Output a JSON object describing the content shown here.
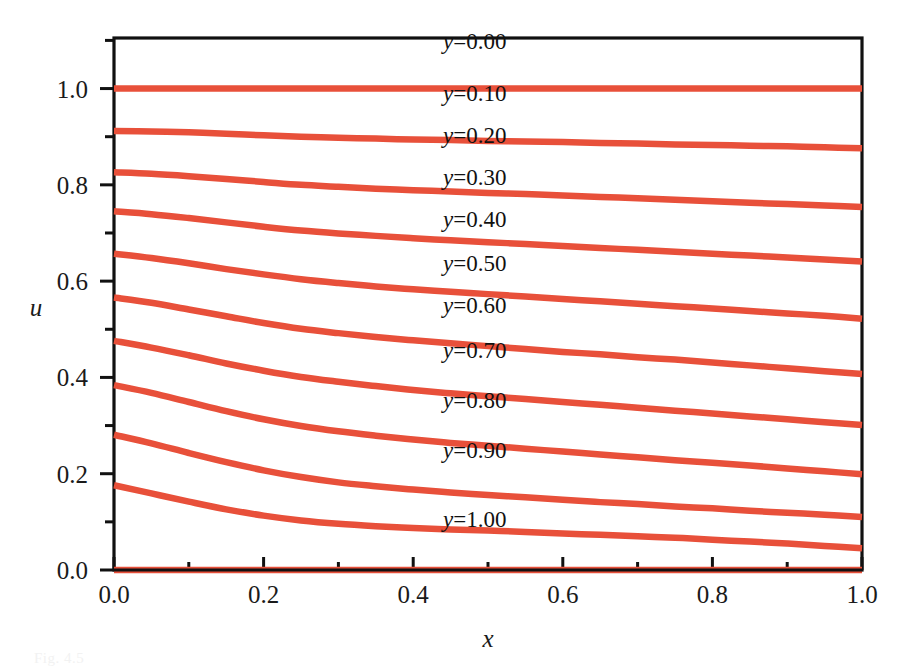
{
  "figure": {
    "background_color": "#ffffff",
    "axis_color": "#111111",
    "curve_color": "#e8503a",
    "caption": "Fig. 4.5"
  },
  "axes": {
    "x_title": "x",
    "y_title": "u",
    "x_ticks": [
      "0.0",
      "0.2",
      "0.4",
      "0.6",
      "0.8",
      "1.0"
    ],
    "y_ticks": [
      "0.0",
      "0.2",
      "0.4",
      "0.6",
      "0.8",
      "1.0"
    ]
  },
  "chart_data": {
    "type": "line",
    "title": "",
    "subtitle": "",
    "xlabel": "x",
    "ylabel": "u",
    "xlim": [
      0.0,
      1.0
    ],
    "ylim": [
      0.0,
      1.105
    ],
    "grid": false,
    "legend": "inline-labels",
    "annotations": [
      "y=0.00",
      "y=0.10",
      "y=0.20",
      "y=0.30",
      "y=0.40",
      "y=0.50",
      "y=0.60",
      "y=0.70",
      "y=0.80",
      "y=0.90",
      "y=1.00"
    ],
    "x": [
      0.0,
      0.05,
      0.1,
      0.15,
      0.2,
      0.25,
      0.3,
      0.35,
      0.4,
      0.45,
      0.5,
      0.55,
      0.6,
      0.65,
      0.7,
      0.75,
      0.8,
      0.85,
      0.9,
      0.95,
      1.0
    ],
    "series": [
      {
        "name": "y=0.00",
        "label": "y=0.00",
        "values": [
          1.0,
          1.0,
          1.0,
          1.0,
          1.0,
          1.0,
          1.0,
          1.0,
          1.0,
          1.0,
          1.0,
          1.0,
          1.0,
          1.0,
          1.0,
          1.0,
          1.0,
          1.0,
          1.0,
          1.0,
          1.0
        ]
      },
      {
        "name": "y=0.10",
        "label": "y=0.10",
        "values": [
          0.912,
          0.911,
          0.909,
          0.906,
          0.903,
          0.9,
          0.898,
          0.896,
          0.894,
          0.893,
          0.891,
          0.89,
          0.889,
          0.887,
          0.886,
          0.884,
          0.883,
          0.881,
          0.88,
          0.878,
          0.876
        ]
      },
      {
        "name": "y=0.20",
        "label": "y=0.20",
        "values": [
          0.826,
          0.823,
          0.818,
          0.812,
          0.806,
          0.8,
          0.796,
          0.792,
          0.789,
          0.786,
          0.783,
          0.781,
          0.778,
          0.775,
          0.772,
          0.769,
          0.766,
          0.763,
          0.76,
          0.757,
          0.754
        ]
      },
      {
        "name": "y=0.30",
        "label": "y=0.30",
        "values": [
          0.745,
          0.739,
          0.731,
          0.722,
          0.713,
          0.705,
          0.699,
          0.694,
          0.689,
          0.685,
          0.681,
          0.677,
          0.673,
          0.669,
          0.665,
          0.661,
          0.657,
          0.653,
          0.649,
          0.645,
          0.641
        ]
      },
      {
        "name": "y=0.40",
        "label": "y=0.40",
        "values": [
          0.657,
          0.648,
          0.637,
          0.625,
          0.614,
          0.604,
          0.596,
          0.589,
          0.583,
          0.578,
          0.573,
          0.568,
          0.563,
          0.558,
          0.553,
          0.548,
          0.543,
          0.538,
          0.533,
          0.528,
          0.522
        ]
      },
      {
        "name": "y=0.50",
        "label": "y=0.50",
        "values": [
          0.566,
          0.555,
          0.541,
          0.527,
          0.513,
          0.501,
          0.492,
          0.484,
          0.477,
          0.471,
          0.465,
          0.459,
          0.453,
          0.448,
          0.442,
          0.437,
          0.431,
          0.425,
          0.419,
          0.413,
          0.407
        ]
      },
      {
        "name": "y=0.60",
        "label": "y=0.60",
        "values": [
          0.476,
          0.462,
          0.446,
          0.429,
          0.414,
          0.401,
          0.391,
          0.382,
          0.374,
          0.367,
          0.361,
          0.355,
          0.349,
          0.343,
          0.337,
          0.331,
          0.325,
          0.319,
          0.313,
          0.307,
          0.301
        ]
      },
      {
        "name": "y=0.70",
        "label": "y=0.70",
        "values": [
          0.384,
          0.368,
          0.349,
          0.33,
          0.313,
          0.299,
          0.288,
          0.279,
          0.271,
          0.264,
          0.258,
          0.252,
          0.246,
          0.24,
          0.234,
          0.228,
          0.223,
          0.217,
          0.211,
          0.205,
          0.199
        ]
      },
      {
        "name": "y=0.80",
        "label": "y=0.80",
        "values": [
          0.281,
          0.263,
          0.243,
          0.224,
          0.207,
          0.193,
          0.182,
          0.174,
          0.167,
          0.161,
          0.156,
          0.151,
          0.146,
          0.141,
          0.137,
          0.132,
          0.128,
          0.123,
          0.119,
          0.115,
          0.11
        ]
      },
      {
        "name": "y=0.90",
        "label": "y=0.90",
        "values": [
          0.176,
          0.159,
          0.142,
          0.126,
          0.113,
          0.103,
          0.096,
          0.091,
          0.087,
          0.084,
          0.082,
          0.079,
          0.076,
          0.073,
          0.07,
          0.067,
          0.063,
          0.059,
          0.055,
          0.05,
          0.045
        ]
      },
      {
        "name": "y=1.00",
        "label": "y=1.00",
        "values": [
          0.0,
          0.0,
          0.0,
          0.0,
          0.0,
          0.0,
          0.0,
          0.0,
          0.0,
          0.0,
          0.0,
          0.0,
          0.0,
          0.0,
          0.0,
          0.0,
          0.0,
          0.0,
          0.0,
          0.0,
          0.0
        ]
      }
    ],
    "label_x_position": 0.44,
    "label_y_offsets": [
      1.082,
      0.975,
      0.886,
      0.8,
      0.712,
      0.622,
      0.533,
      0.44,
      0.337,
      0.233,
      0.09
    ]
  }
}
